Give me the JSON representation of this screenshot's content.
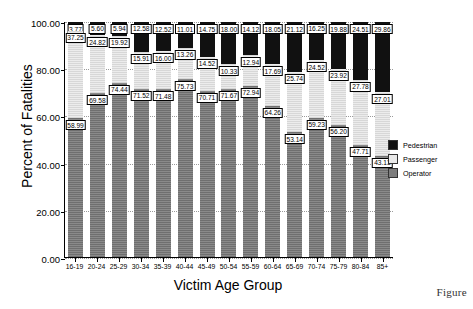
{
  "figure_caption": "Figure",
  "chart_data": {
    "type": "bar",
    "subtype": "stacked-percentage",
    "title": "",
    "xlabel": "Victim Age Group",
    "ylabel": "Percent of Fatalities",
    "ylim": [
      0,
      100
    ],
    "ytick_labels": [
      "0.00",
      "20.00",
      "40.00",
      "60.00",
      "80.00",
      "100.00"
    ],
    "ytick_values": [
      0,
      20,
      40,
      60,
      80,
      100
    ],
    "grid": true,
    "legend_position": "right",
    "categories": [
      "16-19",
      "20-24",
      "25-29",
      "30-34",
      "35-39",
      "40-44",
      "45-49",
      "50-54",
      "55-59",
      "60-64",
      "65-69",
      "70-74",
      "75-79",
      "80-84",
      "85+"
    ],
    "series": [
      {
        "name": "Pedestrian",
        "color": "#111111",
        "stack_order": "top",
        "values": [
          3.77,
          5.6,
          5.94,
          12.58,
          12.52,
          11.01,
          14.75,
          18.0,
          14.12,
          18.05,
          21.12,
          16.25,
          19.88,
          24.51,
          29.86
        ]
      },
      {
        "name": "Passenger",
        "color": "#e9e9e9",
        "stack_order": "middle",
        "values": [
          37.25,
          24.82,
          19.92,
          15.91,
          16.0,
          13.26,
          14.52,
          10.33,
          12.94,
          17.69,
          25.74,
          24.52,
          23.92,
          27.78,
          27.01
        ]
      },
      {
        "name": "Operator",
        "color": "#7d7d7d",
        "stack_order": "bottom",
        "values": [
          58.99,
          69.58,
          74.44,
          71.52,
          71.48,
          75.73,
          70.71,
          71.67,
          72.94,
          64.26,
          53.14,
          59.23,
          56.2,
          47.71,
          43.13
        ]
      }
    ]
  }
}
